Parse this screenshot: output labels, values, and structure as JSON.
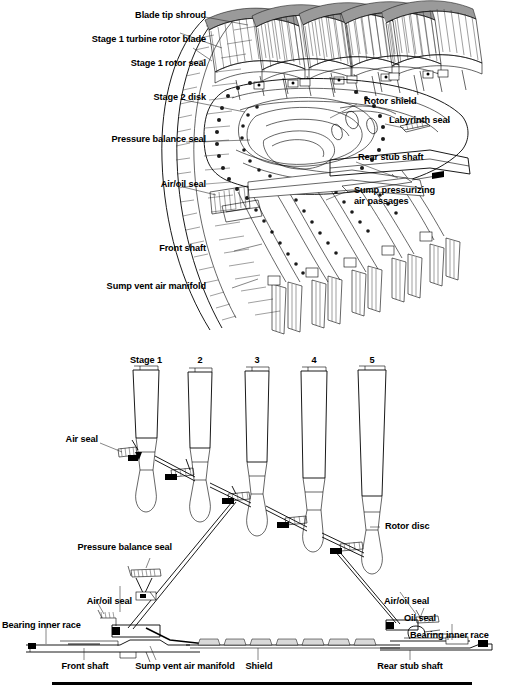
{
  "figure": {
    "ink_color": "#000000",
    "background_color": "#ffffff"
  },
  "top_view": {
    "name": "isometric-cutaway-view",
    "labels": {
      "blade_tip_shroud": "Blade tip shroud",
      "stage1_turbine_rotor_blade": "Stage 1 turbine rotor blade",
      "stage1_rotor_seal": "Stage 1 rotor seal",
      "stage2_disk": "Stage 2 disk",
      "pressure_balance_seal": "Pressure balance seal",
      "air_oil_seal": "Air/oil seal",
      "front_shaft": "Front shaft",
      "sump_vent_air_manifold": "Sump vent air manifold",
      "rotor_shield": "Rotor shield",
      "labyrinth_seal": "Labyrinth seal",
      "rear_stub_shaft": "Rear stub shaft",
      "sump_pressurizing_air_passages_line1": "Sump pressurizing",
      "sump_pressurizing_air_passages_line2": "air passages"
    },
    "blade_rows": 5
  },
  "bottom_view": {
    "name": "cross-section-view",
    "stages": [
      {
        "label": "Stage 1"
      },
      {
        "label": "2"
      },
      {
        "label": "3"
      },
      {
        "label": "4"
      },
      {
        "label": "5"
      }
    ],
    "labels": {
      "air_seal": "Air seal",
      "rotor_disc": "Rotor disc",
      "pressure_balance_seal": "Pressure balance seal",
      "air_oil_seal_left": "Air/oil seal",
      "air_oil_seal_right": "Air/oil seal",
      "oil_seal": "Oil seal",
      "bearing_inner_race_left": "Bearing inner race",
      "bearing_inner_race_right": "Bearing inner race",
      "front_shaft": "Front shaft",
      "sump_vent_air_manifold": "Sump vent air manifold",
      "shield": "Shield",
      "rear_stub_shaft": "Rear stub shaft"
    }
  }
}
